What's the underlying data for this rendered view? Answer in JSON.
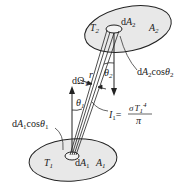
{
  "diagram": {
    "type": "radiative heat exchange between two surfaces",
    "colors": {
      "surface_fill": "#e8e8e8",
      "stroke": "#222222",
      "background": "#ffffff"
    },
    "surface_top": {
      "temperature_label": "T",
      "temperature_sub": "2",
      "area_label": "A",
      "area_sub": "2",
      "element_label": "dA",
      "element_sub": "2"
    },
    "surface_bottom": {
      "temperature_label": "T",
      "temperature_sub": "1",
      "area_label": "A",
      "area_sub": "1",
      "element_label": "dA",
      "element_sub": "1"
    },
    "annotations": {
      "projected_area_2": {
        "pre": "dA",
        "sub": "2",
        "mid": "cos",
        "theta": "θ",
        "theta_sub": "2"
      },
      "projected_area_1": {
        "pre": "dA",
        "sub": "1",
        "mid": "cos",
        "theta": "θ",
        "theta_sub": "1"
      },
      "solid_angle": {
        "pre": "dΩ",
        "sub": "1"
      },
      "distance": "r",
      "angle_2": {
        "sym": "θ",
        "sub": "2"
      },
      "angle_1": {
        "sym": "θ",
        "sub": "1"
      },
      "intensity": {
        "lhs": "I",
        "lhs_sub": "1",
        "eq": "=",
        "num_sigma": "σ",
        "num_T": "T",
        "num_sub": "1",
        "num_exp": "4",
        "den": "π"
      }
    }
  }
}
